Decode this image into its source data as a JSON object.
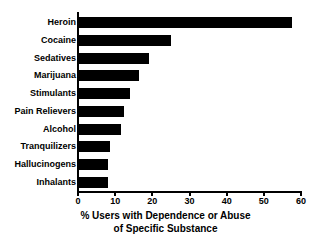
{
  "chart_data": {
    "type": "bar",
    "orientation": "horizontal",
    "title": "",
    "xlabel_line1": "% Users with Dependence or Abuse",
    "xlabel_line2": "of Specific Substance",
    "ylabel": "",
    "xlim": [
      0,
      60
    ],
    "xticks": [
      0,
      10,
      20,
      30,
      40,
      50,
      60
    ],
    "xtick_labels": [
      "0",
      "10",
      "20",
      "30",
      "40",
      "50",
      "60"
    ],
    "grid": false,
    "legend": false,
    "bar_color": "#000000",
    "categories": [
      "Heroin",
      "Cocaine",
      "Sedatives",
      "Marijuana",
      "Stimulants",
      "Pain Relievers",
      "Alcohol",
      "Tranquilizers",
      "Hallucinogens",
      "Inhalants"
    ],
    "values": [
      57.5,
      25,
      19,
      16.5,
      14,
      12.5,
      11.5,
      8.5,
      8,
      8
    ]
  }
}
